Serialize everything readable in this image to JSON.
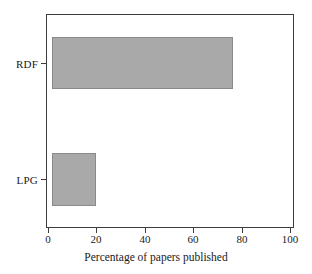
{
  "chart_data": {
    "type": "bar",
    "orientation": "horizontal",
    "title": "",
    "xlabel": "Percentage of papers published",
    "ylabel": "",
    "categories": [
      "RDF",
      "LPG"
    ],
    "values": [
      80,
      21
    ],
    "bar_start": 2,
    "xlim": [
      0,
      106
    ],
    "ylim": [
      0,
      2
    ],
    "xticks": [
      0,
      20,
      40,
      60,
      80,
      100
    ],
    "xticklabels": [
      "0",
      "20",
      "40",
      "60",
      "80",
      "100"
    ],
    "yticklabels": [
      "RDF",
      "LPG"
    ],
    "grid": false,
    "legend": null,
    "colors": {
      "bar_fill": "#a9a9a9",
      "bar_edge": "#8a8a8a",
      "axis": "#3c3c3c",
      "text": "#1a1a1a",
      "background": "#ffffff"
    }
  }
}
